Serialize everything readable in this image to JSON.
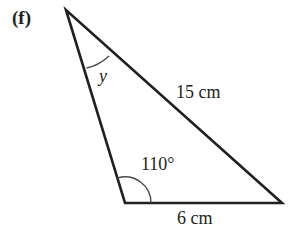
{
  "figure": {
    "part_label": "(f)",
    "shape": "triangle",
    "angles": {
      "top": {
        "label": "y",
        "marked": true
      },
      "bottom_left": {
        "label": "110°",
        "marked": true
      }
    },
    "sides": {
      "hypotenuse": {
        "label": "15 cm"
      },
      "base": {
        "label": "6 cm"
      }
    },
    "colors": {
      "stroke": "#231f20",
      "arc": "#4a4a4a",
      "background": "#ffffff"
    }
  }
}
